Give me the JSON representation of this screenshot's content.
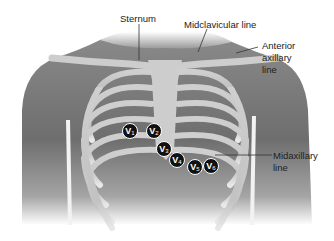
{
  "diagram": {
    "labels": {
      "sternum": "Sternum",
      "midclavicular": "Midclavicular line",
      "anterior_axillary_1": "Anterior",
      "anterior_axillary_2": "axillary",
      "anterior_axillary_3": "line",
      "midaxillary_1": "Midaxillary",
      "midaxillary_2": "line"
    },
    "electrodes": [
      {
        "letter": "V",
        "num": "1"
      },
      {
        "letter": "V",
        "num": "2"
      },
      {
        "letter": "V",
        "num": "3"
      },
      {
        "letter": "V",
        "num": "4"
      },
      {
        "letter": "V",
        "num": "5"
      },
      {
        "letter": "V",
        "num": "6"
      }
    ],
    "colors": {
      "torso": "#7a7a7a",
      "bone": "#c9c9c9",
      "electrode": "#111111",
      "text": "#222222"
    }
  }
}
